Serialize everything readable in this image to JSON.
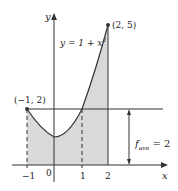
{
  "diagram": {
    "function_label": "y = 1 + x",
    "function_exponent": "2",
    "axis_x_label": "x",
    "axis_y_label": "y",
    "point_left_label": "(−1, 2)",
    "point_right_label": "(2, 5)",
    "favg_label_f": "f",
    "favg_label_sub": "ave",
    "favg_label_value": " = 2",
    "tick_labels": [
      "−1",
      "0",
      "1",
      "2"
    ],
    "colors": {
      "shade": "#d9d9d9",
      "line": "#333333",
      "background": "#ffffff"
    }
  }
}
